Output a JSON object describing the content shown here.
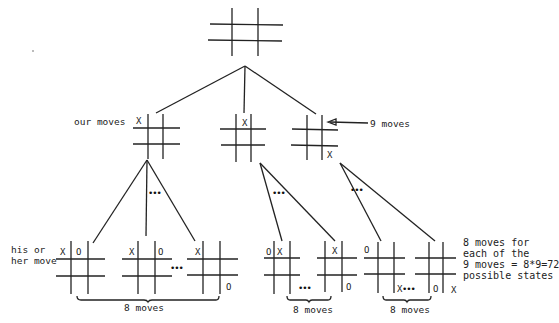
{
  "labels": {
    "our_moves": "our moves",
    "nine_moves": "9 moves",
    "his_or_her_move": "his or\nher move",
    "note": "8 moves for\neach of the\n9 moves = 8*9=72\npossible states",
    "brace_left": "8 moves",
    "brace_mid": "8 moves",
    "brace_right": "8 moves",
    "ellipsis": "•••"
  },
  "boards": {
    "root": {
      "marks": []
    },
    "level1": [
      {
        "marks": [
          {
            "cell": "top-left",
            "symbol": "X"
          }
        ]
      },
      {
        "marks": [
          {
            "cell": "top-center",
            "symbol": "X"
          }
        ]
      },
      {
        "marks": [
          {
            "cell": "bottom-right",
            "symbol": "X"
          }
        ]
      }
    ],
    "level2": [
      {
        "marks": [
          {
            "cell": "top-left",
            "symbol": "X"
          },
          {
            "cell": "top-center",
            "symbol": "O"
          }
        ]
      },
      {
        "marks": [
          {
            "cell": "top-left",
            "symbol": "X"
          },
          {
            "cell": "top-right",
            "symbol": "O"
          }
        ]
      },
      {
        "marks": [
          {
            "cell": "top-left",
            "symbol": "X"
          },
          {
            "cell": "bottom-right",
            "symbol": "O"
          }
        ]
      },
      {
        "marks": [
          {
            "cell": "top-left",
            "symbol": "O"
          },
          {
            "cell": "top-center",
            "symbol": "X"
          }
        ]
      },
      {
        "marks": [
          {
            "cell": "top-center",
            "symbol": "X"
          },
          {
            "cell": "bottom-right",
            "symbol": "O"
          }
        ]
      },
      {
        "marks": [
          {
            "cell": "top-left",
            "symbol": "O"
          },
          {
            "cell": "bottom-center",
            "symbol": "X"
          }
        ]
      },
      {
        "marks": [
          {
            "cell": "bottom-left",
            "symbol": "O"
          },
          {
            "cell": "bottom-right",
            "symbol": "X"
          }
        ]
      }
    ]
  },
  "marks": {
    "l1_a": "X",
    "l1_b": "X",
    "l1_c": "X",
    "l2_1a": "X",
    "l2_1b": "O",
    "l2_2a": "X",
    "l2_2b": "O",
    "l2_3a": "X",
    "l2_3b": "O",
    "l2_4a": "O",
    "l2_4b": "X",
    "l2_5a": "X",
    "l2_5b": "O",
    "l2_6a": "O",
    "l2_6b": "X",
    "l2_7a": "O",
    "l2_7b": "X"
  }
}
